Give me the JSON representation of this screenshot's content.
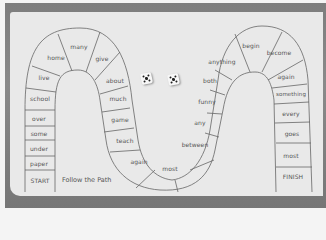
{
  "board": {
    "title": "Follow the Path",
    "start": "START",
    "finish": "FINISH",
    "spaces": [
      {
        "id": "s1",
        "label": "START",
        "x": 40,
        "y": 180
      },
      {
        "id": "s2",
        "label": "paper",
        "x": 39,
        "y": 163
      },
      {
        "id": "s3",
        "label": "under",
        "x": 39,
        "y": 148
      },
      {
        "id": "s4",
        "label": "some",
        "x": 39,
        "y": 133
      },
      {
        "id": "s5",
        "label": "over",
        "x": 39,
        "y": 118
      },
      {
        "id": "s6",
        "label": "school",
        "x": 39,
        "y": 98
      },
      {
        "id": "s7",
        "label": "live",
        "x": 44,
        "y": 77
      },
      {
        "id": "s8",
        "label": "home",
        "x": 56,
        "y": 57
      },
      {
        "id": "s9",
        "label": "many",
        "x": 79,
        "y": 46
      },
      {
        "id": "s10",
        "label": "give",
        "x": 102,
        "y": 58
      },
      {
        "id": "s11",
        "label": "about",
        "x": 115,
        "y": 78
      },
      {
        "id": "s12",
        "label": "much",
        "x": 121,
        "y": 98
      },
      {
        "id": "s13",
        "label": "game",
        "x": 124,
        "y": 118
      },
      {
        "id": "s14",
        "label": "teach",
        "x": 128,
        "y": 139
      },
      {
        "id": "s15",
        "label": "again",
        "x": 139,
        "y": 160
      },
      {
        "id": "s16",
        "label": "most",
        "x": 171,
        "y": 167
      },
      {
        "id": "s17",
        "label": "between",
        "x": 196,
        "y": 144
      },
      {
        "id": "s18",
        "label": "any",
        "x": 200,
        "y": 122
      },
      {
        "id": "s19",
        "label": "funny",
        "x": 208,
        "y": 101
      },
      {
        "id": "s20",
        "label": "both",
        "x": 212,
        "y": 80
      },
      {
        "id": "s21",
        "label": "anything",
        "x": 222,
        "y": 60
      },
      {
        "id": "s22",
        "label": "begin",
        "x": 251,
        "y": 44
      },
      {
        "id": "s23",
        "label": "become",
        "x": 278,
        "y": 52
      },
      {
        "id": "s24",
        "label": "again",
        "x": 285,
        "y": 76
      },
      {
        "id": "s25",
        "label": "something",
        "x": 290,
        "y": 94
      },
      {
        "id": "s26",
        "label": "every",
        "x": 290,
        "y": 113
      },
      {
        "id": "s27",
        "label": "goes",
        "x": 291,
        "y": 133
      },
      {
        "id": "s28",
        "label": "most",
        "x": 290,
        "y": 155
      },
      {
        "id": "s29",
        "label": "FINISH",
        "x": 292,
        "y": 176
      }
    ]
  },
  "dice": [
    {
      "name": "die-left",
      "value": 5,
      "x": 144,
      "y": 74
    },
    {
      "name": "die-right",
      "value": 5,
      "x": 170,
      "y": 75
    }
  ]
}
